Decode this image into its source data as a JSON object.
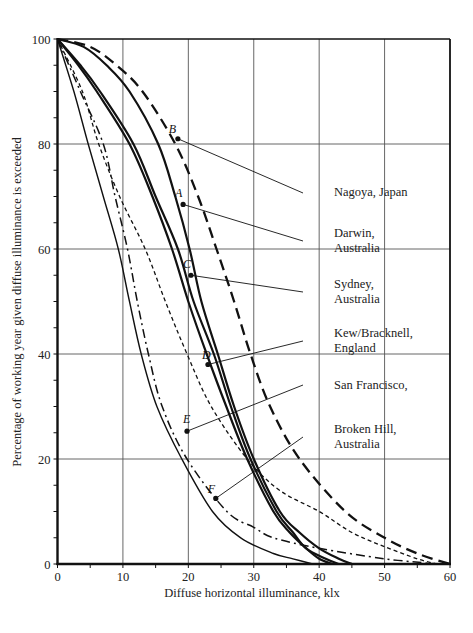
{
  "chart_data": {
    "type": "line",
    "title": "",
    "xlabel": "Diffuse horizontal illuminance, klx",
    "ylabel": "Percentage of working year given diffuse illuminance is exceeded",
    "xlim": [
      0,
      60
    ],
    "ylim": [
      0,
      100
    ],
    "xticks": [
      0,
      10,
      20,
      30,
      40,
      50,
      60
    ],
    "yticks": [
      0,
      20,
      40,
      60,
      80,
      100
    ],
    "grid": true,
    "legend": "none (leader-line labels at right)",
    "series": [
      {
        "name": "Nagoya, Japan",
        "marker_letter": "B",
        "style": "dashed-heavy",
        "marker_point": [
          18.4,
          81
        ],
        "points": [
          [
            0,
            100
          ],
          [
            5,
            98.5
          ],
          [
            9,
            95
          ],
          [
            13,
            90
          ],
          [
            18,
            80
          ],
          [
            21.5,
            70
          ],
          [
            24.3,
            60
          ],
          [
            27,
            50
          ],
          [
            29.5,
            40
          ],
          [
            32.5,
            30
          ],
          [
            37,
            20
          ],
          [
            44,
            10
          ],
          [
            50,
            5
          ],
          [
            55,
            2
          ],
          [
            60,
            0
          ]
        ]
      },
      {
        "name": "Darwin, Australia",
        "marker_letter": "A",
        "style": "solid-heavy",
        "marker_point": [
          19.2,
          68.5
        ],
        "points": [
          [
            0,
            100
          ],
          [
            4,
            98.5
          ],
          [
            7.5,
            95
          ],
          [
            11,
            90
          ],
          [
            15.4,
            80
          ],
          [
            18,
            70
          ],
          [
            20.2,
            60
          ],
          [
            22,
            50
          ],
          [
            24.5,
            40
          ],
          [
            27,
            30
          ],
          [
            30,
            20
          ],
          [
            34,
            10
          ],
          [
            37,
            6
          ],
          [
            40,
            3
          ],
          [
            43,
            1
          ],
          [
            45,
            0
          ]
        ]
      },
      {
        "name": "Sydney, Australia",
        "marker_letter": "C",
        "style": "solid-heavy",
        "marker_point": [
          20.4,
          55
        ],
        "points": [
          [
            0,
            100
          ],
          [
            3.5,
            95
          ],
          [
            6.5,
            90
          ],
          [
            11.6,
            80
          ],
          [
            15,
            70
          ],
          [
            18.4,
            60
          ],
          [
            20.8,
            50
          ],
          [
            23.9,
            40
          ],
          [
            26.5,
            30
          ],
          [
            29.5,
            20
          ],
          [
            33.5,
            10
          ],
          [
            36,
            6
          ],
          [
            38,
            3
          ],
          [
            41,
            1
          ],
          [
            43,
            0
          ]
        ]
      },
      {
        "name": "Kew/Bracknell, England",
        "marker_letter": "D",
        "style": "solid-heavy",
        "marker_point": [
          23.0,
          38
        ],
        "points": [
          [
            0,
            100
          ],
          [
            3.2,
            95
          ],
          [
            6,
            90
          ],
          [
            11,
            80
          ],
          [
            14.5,
            70
          ],
          [
            17.5,
            60
          ],
          [
            20,
            50
          ],
          [
            22.8,
            40
          ],
          [
            25.8,
            30
          ],
          [
            29,
            20
          ],
          [
            33,
            10
          ],
          [
            35.5,
            6
          ],
          [
            38,
            3
          ],
          [
            40,
            1
          ],
          [
            42,
            0
          ]
        ]
      },
      {
        "name": "San Francisco,",
        "marker_letter": "E",
        "style": "dash-dot",
        "marker_point": [
          19.8,
          25.3
        ],
        "points": [
          [
            0,
            100
          ],
          [
            3.5,
            90
          ],
          [
            7,
            80
          ],
          [
            8.8,
            70
          ],
          [
            10.7,
            60
          ],
          [
            12.2,
            50
          ],
          [
            13.9,
            40
          ],
          [
            16,
            30
          ],
          [
            19.8,
            20
          ],
          [
            25.9,
            10
          ],
          [
            30,
            7
          ],
          [
            33,
            5
          ],
          [
            40,
            3
          ],
          [
            50,
            1
          ],
          [
            58,
            0
          ]
        ]
      },
      {
        "name": "Broken Hill, Australia",
        "marker_letter": "F",
        "style": "solid-thin",
        "marker_point": [
          24.2,
          12.5
        ],
        "points": [
          [
            0,
            100
          ],
          [
            2.5,
            90
          ],
          [
            4.7,
            80
          ],
          [
            7,
            70
          ],
          [
            9.3,
            60
          ],
          [
            11,
            50
          ],
          [
            12.8,
            40
          ],
          [
            15.2,
            30
          ],
          [
            19,
            20
          ],
          [
            23.7,
            10
          ],
          [
            28,
            5
          ],
          [
            33,
            2
          ],
          [
            36,
            1
          ],
          [
            39,
            0
          ]
        ]
      },
      {
        "name": "",
        "marker_letter": "",
        "style": "dotted",
        "points": [
          [
            0,
            100
          ],
          [
            3.8,
            90
          ],
          [
            6.3,
            80
          ],
          [
            9.5,
            70
          ],
          [
            13.4,
            60
          ],
          [
            16.5,
            50
          ],
          [
            19.8,
            40
          ],
          [
            23.5,
            30
          ],
          [
            29,
            20
          ],
          [
            34,
            14
          ],
          [
            40,
            10
          ],
          [
            45,
            6
          ],
          [
            50,
            3.3
          ],
          [
            55,
            1
          ],
          [
            58,
            0
          ]
        ]
      }
    ]
  },
  "labels": {
    "x_ticks": [
      "0",
      "10",
      "20",
      "30",
      "40",
      "50",
      "60"
    ],
    "y_ticks": [
      "0",
      "20",
      "40",
      "60",
      "80",
      "100"
    ],
    "locations": [
      {
        "letter": "B",
        "lines": [
          "Nagoya, Japan"
        ]
      },
      {
        "letter": "A",
        "lines": [
          "Darwin,",
          "Australia"
        ]
      },
      {
        "letter": "C",
        "lines": [
          "Sydney,",
          "Australia"
        ]
      },
      {
        "letter": "D",
        "lines": [
          "Kew/Bracknell,",
          "England"
        ]
      },
      {
        "letter": "E",
        "lines": [
          "San Francisco,"
        ]
      },
      {
        "letter": "F",
        "lines": [
          "Broken Hill,",
          "Australia"
        ]
      }
    ]
  },
  "colors": {
    "ink": "#111111",
    "grid": "#555555",
    "background": "#ffffff"
  }
}
